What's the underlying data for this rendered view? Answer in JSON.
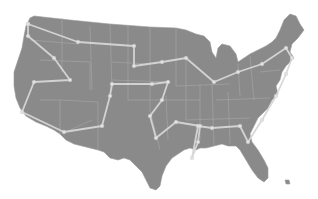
{
  "map": {
    "subject": "United States contiguous states",
    "colors": {
      "land": "#8a8a8a",
      "state_borders": "#a8a8a8",
      "route": "#d6d6d6",
      "nodes": "#e2e2e2",
      "background": "#ffffff"
    },
    "route": {
      "description": "Road trip route visiting stops across the contiguous US",
      "points": [
        [
          28,
          24
        ],
        [
          78,
          42
        ],
        [
          134,
          46
        ],
        [
          134,
          66
        ],
        [
          162,
          62
        ],
        [
          186,
          58
        ],
        [
          214,
          82
        ],
        [
          238,
          72
        ],
        [
          262,
          64
        ],
        [
          286,
          48
        ],
        [
          292,
          58
        ],
        [
          286,
          74
        ],
        [
          276,
          96
        ],
        [
          262,
          120
        ],
        [
          248,
          142
        ],
        [
          240,
          126
        ],
        [
          212,
          128
        ],
        [
          198,
          126
        ],
        [
          192,
          158
        ],
        [
          198,
          142
        ],
        [
          200,
          126
        ],
        [
          176,
          122
        ],
        [
          156,
          138
        ],
        [
          150,
          116
        ],
        [
          162,
          100
        ],
        [
          168,
          82
        ],
        [
          152,
          84
        ],
        [
          112,
          84
        ],
        [
          110,
          96
        ],
        [
          102,
          126
        ],
        [
          64,
          132
        ],
        [
          22,
          112
        ],
        [
          34,
          82
        ],
        [
          70,
          80
        ],
        [
          54,
          58
        ],
        [
          28,
          36
        ],
        [
          28,
          24
        ]
      ]
    }
  }
}
